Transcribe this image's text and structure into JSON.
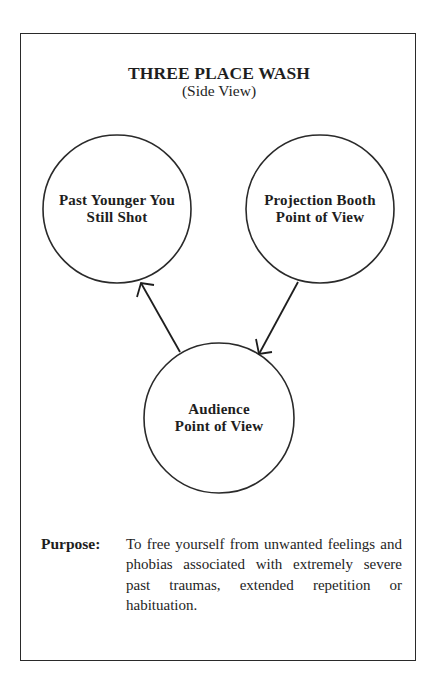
{
  "header": {
    "title": "THREE PLACE WASH",
    "subtitle": "(Side View)"
  },
  "diagram": {
    "nodes": [
      {
        "id": "past",
        "label_line1": "Past Younger You",
        "label_line2": "Still Shot"
      },
      {
        "id": "booth",
        "label_line1": "Projection Booth",
        "label_line2": "Point of View"
      },
      {
        "id": "audience",
        "label_line1": "Audience",
        "label_line2": "Point of View"
      }
    ],
    "edges": [
      {
        "from": "booth",
        "to": "audience",
        "style": "open-arrow"
      },
      {
        "from": "audience",
        "to": "past",
        "style": "open-arrow"
      }
    ],
    "colors": {
      "stroke": "#2a2a2a",
      "background": "#ffffff",
      "text": "#1e1e1e"
    }
  },
  "purpose": {
    "label": "Purpose:",
    "text": "To free yourself from unwanted feelings and phobias associated with extremely severe past traumas, extended repetition or habituation."
  }
}
